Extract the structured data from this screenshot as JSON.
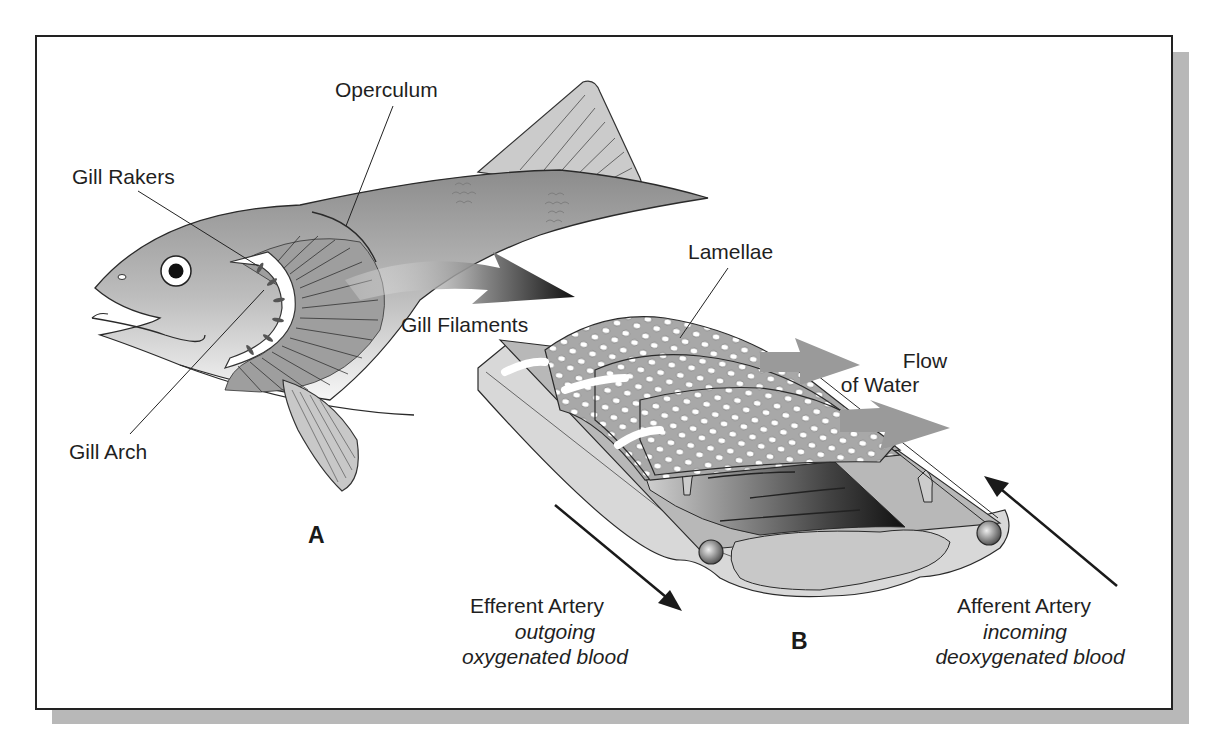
{
  "figure": {
    "colors": {
      "frame_border": "#222222",
      "shadow": "#b8b8b8",
      "fish_body_dark": "#8a8a8a",
      "fish_body_light": "#f2f2f2",
      "fin": "#c8c8c8",
      "lamella": "#a9a9a9",
      "flow_arrow": "#9a9a9a",
      "outline": "#2a2a2a"
    },
    "panel_a": {
      "letter": "A",
      "labels": {
        "operculum": "Operculum",
        "gill_rakers": "Gill Rakers",
        "gill_filaments": "Gill Filaments",
        "gill_arch": "Gill Arch"
      }
    },
    "panel_b": {
      "letter": "B",
      "labels": {
        "lamellae": "Lamellae",
        "flow_line1": "Flow",
        "flow_line2": "of Water",
        "efferent_title": "Efferent Artery",
        "efferent_line1": "outgoing",
        "efferent_line2": "oxygenated blood",
        "afferent_title": "Afferent Artery",
        "afferent_line1": "incoming",
        "afferent_line2": "deoxygenated blood"
      }
    }
  }
}
